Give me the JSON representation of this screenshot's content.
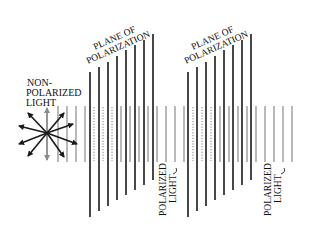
{
  "labels": {
    "non_polarized_line1": "NON-",
    "non_polarized_line2": "POLARIZED",
    "non_polarized_line3": "LIGHT",
    "plane1_line1": "PLANE OF",
    "plane1_line2": "POLARIZATION",
    "plane2_line1": "PLANE OF",
    "plane2_line2": "POLARIZATION",
    "polarized1_line1": "POLARIZED",
    "polarized1_line2": "LIGHT",
    "polarized2_line1": "POLARIZED",
    "polarized2_line2": "LIGHT"
  },
  "colors": {
    "black_line": "#1a1a1a",
    "gray_line": "#8a8a8a",
    "dotted_line": "#7a7a7a",
    "gray_arrow": "#8a8a8a"
  },
  "components": [
    "non-polarized light source (starburst of arrows)",
    "polarizer plane 1 (8 black lines)",
    "polarizer plane 2 (8 black lines)",
    "polarized light wave (gray vertical lines)"
  ]
}
